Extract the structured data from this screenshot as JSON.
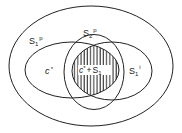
{
  "diagram": {
    "type": "venn",
    "colors": {
      "stroke": "#222222",
      "hatch": "#222222",
      "background": "#ffffff"
    },
    "sets": [
      {
        "id": "outer",
        "label_base": "S",
        "label_sub": "1",
        "label_sup": "p"
      },
      {
        "id": "vertical",
        "label_base": "S",
        "label_sub": "2",
        "label_sup": "p"
      },
      {
        "id": "left",
        "label_base": "c",
        "label_sup": "*"
      },
      {
        "id": "right",
        "label_base": "S",
        "label_sub": "1",
        "label_sup": "i"
      }
    ],
    "regions": {
      "intersection": {
        "label_a": "c",
        "label_a_sup": "*",
        "label_op": "+",
        "label_b": "S",
        "label_b_sub": "1",
        "hatched": true
      }
    }
  }
}
